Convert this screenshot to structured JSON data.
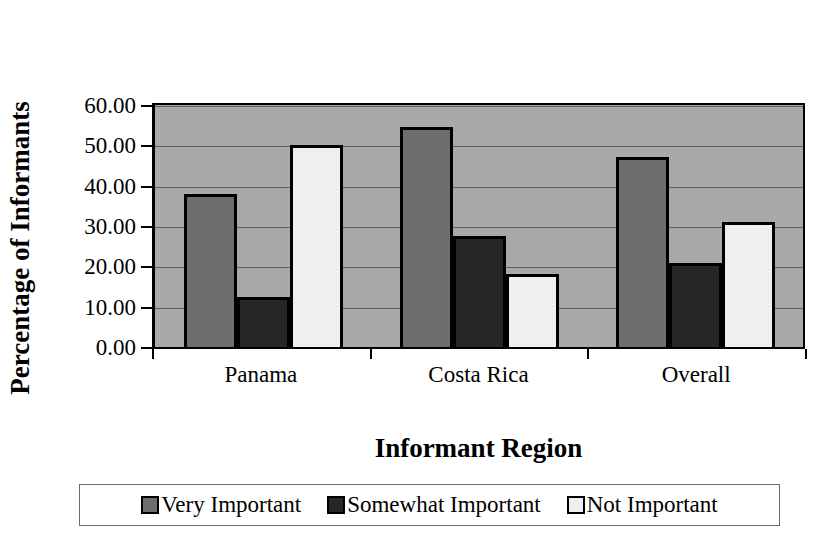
{
  "chart_data": {
    "type": "bar",
    "title": "",
    "xlabel": "Informant Region",
    "ylabel": "Percentage of Informants",
    "categories": [
      "Panama",
      "Costa Rica",
      "Overall"
    ],
    "series": [
      {
        "name": "Very Important",
        "values": [
          38.0,
          54.5,
          47.0
        ],
        "color": "#6e6e6e"
      },
      {
        "name": "Somewhat Important",
        "values": [
          12.5,
          27.5,
          20.8
        ],
        "color": "#262626"
      },
      {
        "name": "Not Important",
        "values": [
          50.0,
          18.0,
          31.0
        ],
        "color": "#efefef"
      }
    ],
    "ylim": [
      0,
      60
    ],
    "yticks": [
      60,
      50,
      40,
      30,
      20,
      10,
      0
    ],
    "ytick_labels": [
      "60.00",
      "50.00",
      "40.00",
      "30.00",
      "20.00",
      "10.00",
      "0.00"
    ],
    "grid": true,
    "grid_axis": "y",
    "legend_position": "bottom",
    "plot_background": "#a9a9a9",
    "figure_background": "#ffffff",
    "axis_color": "#000000",
    "gridline_color": "#5e5e5e"
  },
  "legend": {
    "entries": [
      {
        "label": "Very Important"
      },
      {
        "label": "Somewhat Important"
      },
      {
        "label": "Not Important"
      }
    ]
  }
}
